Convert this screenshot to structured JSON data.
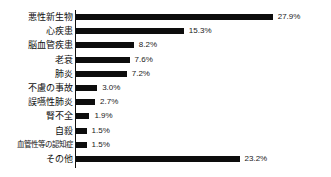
{
  "chart_data": {
    "type": "bar",
    "orientation": "horizontal",
    "title": "",
    "subtitle": "",
    "xlabel": "",
    "ylabel": "",
    "grid": false,
    "legend": null,
    "axis": {
      "value_axis_range": [
        0,
        30
      ],
      "value_unit": "%",
      "value_axis_visible": false,
      "category_axis_line": true
    },
    "categories": [
      "悪性新生物",
      "心疾患",
      "脳血管疾患",
      "老衰",
      "肺炎",
      "不慮の事故",
      "誤嚥性肺炎",
      "腎不全",
      "自殺",
      "血管性等の認知症",
      "その他"
    ],
    "values": [
      27.9,
      15.3,
      8.2,
      7.6,
      7.2,
      3.0,
      2.7,
      1.9,
      1.5,
      1.5,
      23.2
    ],
    "value_labels": [
      "27.9%",
      "15.3%",
      "8.2%",
      "7.6%",
      "7.2%",
      "3.0%",
      "2.7%",
      "1.9%",
      "1.5%",
      "1.5%",
      "23.2%"
    ],
    "colors": {
      "bar": "#0d0d0d",
      "axis": "#111111",
      "text": "#111111",
      "background": "#ffffff"
    }
  },
  "rows": [
    {
      "label": "悪性新生物",
      "value_label": "27.9%"
    },
    {
      "label": "心疾患",
      "value_label": "15.3%"
    },
    {
      "label": "脳血管疾患",
      "value_label": "8.2%"
    },
    {
      "label": "老衰",
      "value_label": "7.6%"
    },
    {
      "label": "肺炎",
      "value_label": "7.2%"
    },
    {
      "label": "不慮の事故",
      "value_label": "3.0%"
    },
    {
      "label": "誤嚥性肺炎",
      "value_label": "2.7%"
    },
    {
      "label": "腎不全",
      "value_label": "1.9%"
    },
    {
      "label": "自殺",
      "value_label": "1.5%"
    },
    {
      "label": "血管性等の認知症",
      "value_label": "1.5%"
    },
    {
      "label": "その他",
      "value_label": "23.2%"
    }
  ]
}
